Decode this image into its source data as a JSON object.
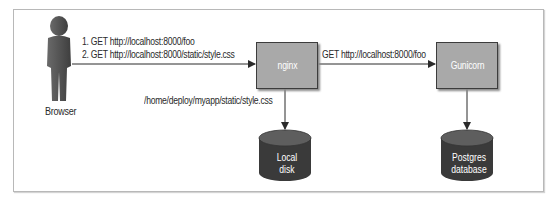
{
  "diagram": {
    "title": "",
    "nodes": {
      "browser": {
        "label": "Browser",
        "shape": "person"
      },
      "nginx": {
        "label": "nginx",
        "shape": "box"
      },
      "gunicorn": {
        "label": "Gunicorn",
        "shape": "box"
      },
      "local_disk": {
        "label_line1": "Local",
        "label_line2": "disk",
        "shape": "cylinder"
      },
      "postgres": {
        "label_line1": "Postgres",
        "label_line2": "database",
        "shape": "cylinder"
      }
    },
    "edges": {
      "browser_to_nginx": {
        "line1": "1. GET http://localhost:8000/foo",
        "line2": "2. GET http://localhost:8000/static/style.css"
      },
      "nginx_to_disk": {
        "label": "/home/deploy/myapp/static/style.css"
      },
      "nginx_to_gunicorn": {
        "label": "GET http://localhost:8000/foo"
      },
      "gunicorn_to_postgres": {
        "label": ""
      }
    },
    "colors": {
      "box_fill": "#a9a9a9",
      "box_border": "#3c3c3c",
      "person_fill": "#555555",
      "cylinder_fill": "#3a3a3a",
      "cylinder_top": "#5e5e5e",
      "arrow": "#2a2a2a",
      "frame_border": "#b8b8b8"
    }
  }
}
